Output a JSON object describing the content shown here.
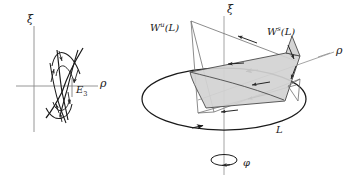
{
  "figure": {
    "colors": {
      "stroke": "#1a1a1a",
      "thin_stroke": "#6e6e6e",
      "axis": "#8a8a8a",
      "surface_fill": "#d2d2d2",
      "surface_edge": "#4a4a4a",
      "background": "#ffffff"
    }
  },
  "left_panel": {
    "name": "saddle-phase-portrait",
    "axes": {
      "vertical_label": "ξ",
      "horizontal_label": "ρ"
    },
    "equilibrium_label": "E",
    "equilibrium_subscript": "3",
    "description": "Saddle equilibrium with two separatrix branch pairs and flow direction arrows"
  },
  "right_panel": {
    "name": "invariant-manifolds-3d",
    "axes": {
      "vertical_label": "ξ",
      "radial_label": "ρ",
      "rotation_label": "φ"
    },
    "orbit_label": "L",
    "unstable_manifold": {
      "base": "W",
      "superscript": "u",
      "argument": "(L)",
      "full": "Wᵘ(L)"
    },
    "stable_manifold": {
      "base": "W",
      "superscript": "s",
      "argument": "(L)",
      "full": "Wˢ(L)"
    },
    "description": "Periodic orbit L shown as a large ellipse, with a shaded stable manifold sheet and a narrow unstable manifold sheet intersecting along the orbit; small ellipse at the bottom indicates the rotation direction phi about the xi axis"
  }
}
